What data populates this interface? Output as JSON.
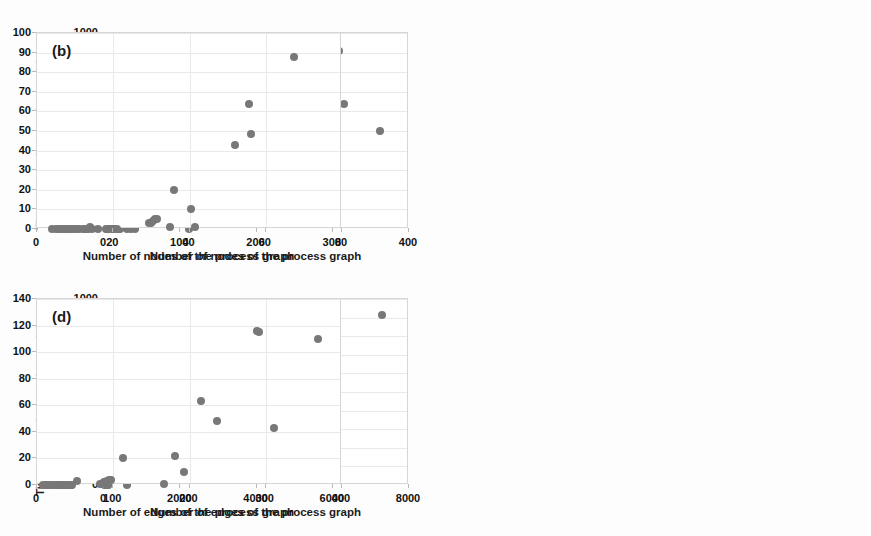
{
  "figure": {
    "background": "#fdfdfd",
    "marker_color": "#787878",
    "grid_color": "#e9e9e9"
  },
  "chart_data": [
    {
      "id": "a",
      "type": "scatter",
      "tag": "(a)",
      "title": "",
      "xlabel": "Number of nodes of the process graph",
      "ylabel": "Time contraction tree (seconds)",
      "xlim": [
        0,
        400
      ],
      "ylim": [
        0,
        1000
      ],
      "xticks": [
        0,
        100,
        200,
        300,
        400
      ],
      "yticks": [
        0,
        100,
        200,
        300,
        400,
        500,
        600,
        700,
        800,
        900,
        1000
      ],
      "grid": true,
      "legend": "none",
      "points": [
        [
          4,
          0
        ],
        [
          5,
          0
        ],
        [
          6,
          0
        ],
        [
          7,
          0
        ],
        [
          8,
          0
        ],
        [
          9,
          0
        ],
        [
          10,
          0
        ],
        [
          11,
          0
        ],
        [
          12,
          0
        ],
        [
          13,
          0
        ],
        [
          14,
          0
        ],
        [
          15,
          0
        ],
        [
          16,
          0
        ],
        [
          17,
          0
        ],
        [
          18,
          0
        ],
        [
          19,
          0
        ],
        [
          20,
          0
        ],
        [
          21,
          0
        ],
        [
          30,
          2
        ],
        [
          31,
          3
        ],
        [
          31,
          5
        ],
        [
          32,
          4
        ],
        [
          33,
          6
        ],
        [
          35,
          1
        ],
        [
          36,
          20
        ],
        [
          40,
          10
        ],
        [
          41,
          1
        ],
        [
          50,
          43
        ],
        [
          52,
          48
        ],
        [
          53,
          55
        ],
        [
          55,
          64
        ],
        [
          56,
          60
        ],
        [
          67,
          88
        ],
        [
          110,
          120
        ],
        [
          112,
          2
        ],
        [
          308,
          910
        ],
        [
          315,
          640
        ],
        [
          362,
          498
        ]
      ]
    },
    {
      "id": "b",
      "type": "scatter",
      "tag": "(b)",
      "title": "",
      "xlabel": "Number of nodes of the process graph",
      "ylabel": "",
      "xlim": [
        0,
        80
      ],
      "ylim": [
        0,
        100
      ],
      "xticks": [
        0,
        20,
        40,
        60,
        80
      ],
      "yticks": [
        0,
        10,
        20,
        30,
        40,
        50,
        60,
        70,
        80,
        90,
        100
      ],
      "grid": true,
      "legend": "none",
      "points": [
        [
          4,
          0
        ],
        [
          5,
          0
        ],
        [
          5.5,
          0
        ],
        [
          6,
          0
        ],
        [
          6.5,
          0
        ],
        [
          7,
          0
        ],
        [
          7.5,
          0
        ],
        [
          8,
          0
        ],
        [
          8.5,
          0
        ],
        [
          9,
          0
        ],
        [
          9.5,
          0
        ],
        [
          10,
          0
        ],
        [
          10.5,
          0
        ],
        [
          11,
          0
        ],
        [
          12,
          0
        ],
        [
          12.5,
          0
        ],
        [
          13,
          0
        ],
        [
          13.5,
          0
        ],
        [
          14,
          1
        ],
        [
          14.5,
          0
        ],
        [
          16,
          0
        ],
        [
          18,
          0
        ],
        [
          18.5,
          0
        ],
        [
          19,
          0
        ],
        [
          19.5,
          0
        ],
        [
          20,
          0
        ],
        [
          20.5,
          0
        ],
        [
          21,
          0
        ],
        [
          29.5,
          3
        ],
        [
          30,
          3
        ],
        [
          30.5,
          4
        ],
        [
          31,
          5
        ],
        [
          31.5,
          5
        ],
        [
          35,
          1
        ],
        [
          36,
          20
        ],
        [
          40.5,
          10
        ],
        [
          41.5,
          1
        ],
        [
          52,
          43
        ],
        [
          55.5,
          64
        ],
        [
          56,
          48.5
        ],
        [
          67.5,
          88
        ]
      ]
    },
    {
      "id": "c",
      "type": "scatter",
      "tag": "(c)",
      "title": "",
      "xlabel": "Number of edges of the process graph",
      "ylabel": "Time contraction tree (seconds)",
      "xlim": [
        0,
        8000
      ],
      "ylim": [
        0,
        1000
      ],
      "xticks": [
        0,
        2000,
        4000,
        6000,
        8000
      ],
      "yticks": [
        0,
        100,
        200,
        300,
        400,
        500,
        600,
        700,
        800,
        900,
        1000
      ],
      "grid": true,
      "legend": "none",
      "points": [
        [
          20,
          0
        ],
        [
          30,
          0
        ],
        [
          40,
          0
        ],
        [
          50,
          0
        ],
        [
          60,
          0
        ],
        [
          70,
          0
        ],
        [
          80,
          0
        ],
        [
          90,
          1
        ],
        [
          100,
          1
        ],
        [
          110,
          2
        ],
        [
          120,
          3
        ],
        [
          130,
          10
        ],
        [
          140,
          20
        ],
        [
          150,
          22
        ],
        [
          160,
          43
        ],
        [
          170,
          48
        ],
        [
          180,
          30
        ],
        [
          190,
          40
        ],
        [
          200,
          45
        ],
        [
          230,
          110
        ],
        [
          250,
          120
        ],
        [
          240,
          100
        ],
        [
          600,
          2
        ],
        [
          1000,
          628
        ],
        [
          2000,
          495
        ],
        [
          7300,
          912
        ]
      ]
    },
    {
      "id": "d",
      "type": "scatter",
      "tag": "(d)",
      "title": "",
      "xlabel": "Number of edges of the process graph",
      "ylabel": "",
      "xlim": [
        0,
        400
      ],
      "ylim": [
        0,
        140
      ],
      "xticks": [
        0,
        100,
        200,
        300,
        400
      ],
      "yticks": [
        0,
        20,
        40,
        60,
        80,
        100,
        120,
        140
      ],
      "grid": true,
      "legend": "none",
      "points": [
        [
          8,
          0
        ],
        [
          12,
          0
        ],
        [
          15,
          0
        ],
        [
          18,
          0
        ],
        [
          20,
          0
        ],
        [
          22,
          0
        ],
        [
          24,
          0
        ],
        [
          26,
          0
        ],
        [
          28,
          0
        ],
        [
          30,
          0
        ],
        [
          32,
          0
        ],
        [
          34,
          0
        ],
        [
          36,
          0
        ],
        [
          38,
          0
        ],
        [
          40,
          0
        ],
        [
          42,
          0
        ],
        [
          44,
          0
        ],
        [
          46,
          0
        ],
        [
          52,
          3
        ],
        [
          82,
          1
        ],
        [
          85,
          1
        ],
        [
          88,
          2
        ],
        [
          90,
          2
        ],
        [
          92,
          3
        ],
        [
          95,
          4
        ],
        [
          97,
          4
        ],
        [
          113,
          20
        ],
        [
          166,
          1
        ],
        [
          181,
          22
        ],
        [
          193,
          10
        ],
        [
          215,
          63
        ],
        [
          236,
          48
        ],
        [
          288,
          116
        ],
        [
          291,
          115
        ],
        [
          311,
          43
        ],
        [
          369,
          110
        ]
      ]
    }
  ]
}
